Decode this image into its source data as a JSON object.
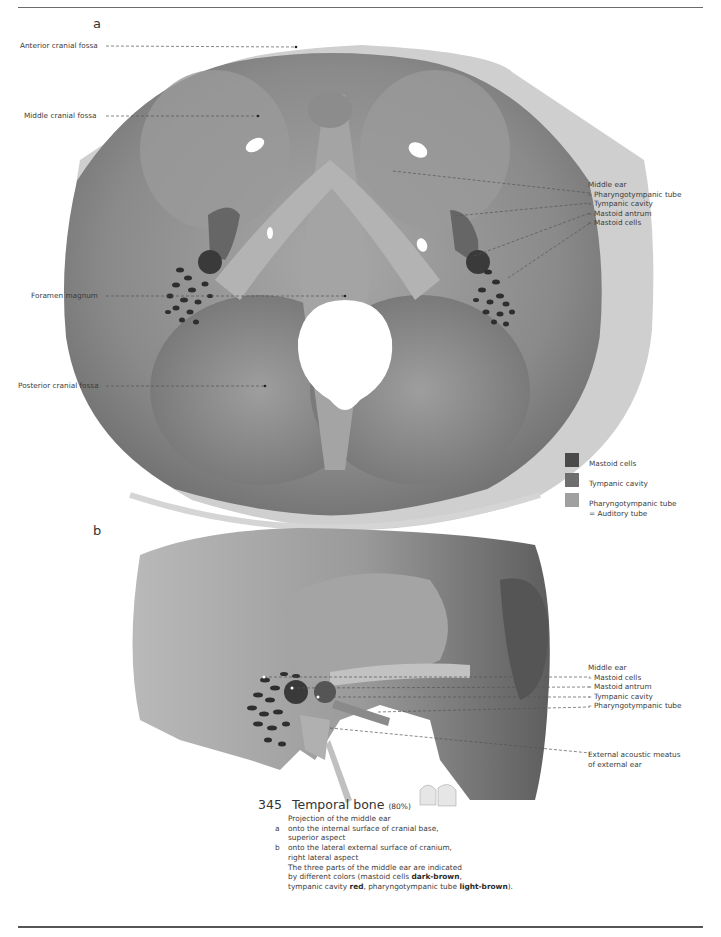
{
  "figure": {
    "number": "345",
    "title": "Temporal bone",
    "scale": "(80%)",
    "caption": {
      "intro": "Projection of the middle ear",
      "items": [
        {
          "key": "a",
          "lines": [
            "onto the internal surface of cranial base,",
            "superior aspect"
          ]
        },
        {
          "key": "b",
          "lines": [
            "onto the lateral external surface of cranium,",
            "right lateral aspect"
          ]
        }
      ],
      "note_lines": [
        "The three parts of the middle ear are indicated",
        "by different colors (mastoid cells "
      ],
      "note_bold_1": "dark-brown",
      "note_mid_1": ",",
      "note_line3_a": "tympanic cavity ",
      "note_bold_2": "red",
      "note_line3_b": ", pharyngotympanic tube ",
      "note_bold_3": "light-brown",
      "note_line3_c": ")."
    }
  },
  "panel_a": {
    "letter": "a",
    "left_labels": [
      {
        "text": "Anterior cranial fossa"
      },
      {
        "text": "Middle cranial fossa"
      },
      {
        "text": "Foramen magnum"
      },
      {
        "text": "Posterior cranial fossa"
      }
    ],
    "right_group": {
      "heading": "Middle ear",
      "items": [
        "– Pharyngotympanic tube",
        "– Tympanic cavity",
        "– Mastoid antrum",
        "– Mastoid cells"
      ]
    }
  },
  "legend": {
    "items": [
      {
        "label": "Mastoid cells",
        "color": "#4a4a4a"
      },
      {
        "label": "Tympanic cavity",
        "color": "#6e6e6e"
      },
      {
        "label": "Pharyngotympanic tube",
        "label2": "= Auditory tube",
        "color": "#a0a0a0"
      }
    ]
  },
  "panel_b": {
    "letter": "b",
    "right_group": {
      "heading": "Middle ear",
      "items": [
        "– Mastoid cells",
        "– Mastoid antrum",
        "– Tympanic cavity",
        "– Pharyngotympanic tube"
      ]
    },
    "external_label": [
      "External acoustic meatus",
      "of external ear"
    ]
  }
}
